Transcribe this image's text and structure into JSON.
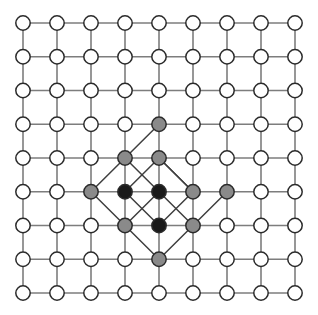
{
  "figure": {
    "type": "node-link-diagram",
    "canvas": {
      "width": 318,
      "height": 315,
      "background": "#ffffff"
    },
    "grid": {
      "columns": 9,
      "rows": 9,
      "origin_x": 23,
      "origin_y": 23,
      "spacing_x": 34,
      "spacing_y": 33.75,
      "node_radius": 7.2,
      "edge_color": "#7d7d7d",
      "edge_width": 1.6
    },
    "palette": {
      "white": "#ffffff",
      "gray": "#8a8a8a",
      "black": "#1a1a1a",
      "node_outline": "#2b2b2b",
      "grid_edge": "#7d7d7d",
      "diagonal_edge": "#3f3f3f"
    },
    "legend": {
      "white_label": "unoccupied site",
      "gray_label": "boundary site",
      "black_label": "core site"
    },
    "counts": {
      "total_nodes": 81,
      "white_nodes": 69,
      "gray_nodes": 9,
      "black_nodes": 3,
      "grid_edges": 144,
      "diagonal_edges": 14
    },
    "black_nodes": [
      {
        "col": 3,
        "row": 5
      },
      {
        "col": 4,
        "row": 5
      },
      {
        "col": 4,
        "row": 6
      }
    ],
    "gray_nodes": [
      {
        "col": 4,
        "row": 3
      },
      {
        "col": 3,
        "row": 4
      },
      {
        "col": 4,
        "row": 4
      },
      {
        "col": 2,
        "row": 5
      },
      {
        "col": 5,
        "row": 5
      },
      {
        "col": 6,
        "row": 5
      },
      {
        "col": 3,
        "row": 6
      },
      {
        "col": 5,
        "row": 6
      },
      {
        "col": 4,
        "row": 7
      }
    ],
    "diagonal_edges": [
      {
        "from": {
          "col": 3,
          "row": 4
        },
        "to": {
          "col": 4,
          "row": 3
        }
      },
      {
        "from": {
          "col": 2,
          "row": 5
        },
        "to": {
          "col": 3,
          "row": 4
        }
      },
      {
        "from": {
          "col": 3,
          "row": 4
        },
        "to": {
          "col": 4,
          "row": 5
        }
      },
      {
        "from": {
          "col": 4,
          "row": 4
        },
        "to": {
          "col": 3,
          "row": 5
        }
      },
      {
        "from": {
          "col": 4,
          "row": 4
        },
        "to": {
          "col": 5,
          "row": 5
        }
      },
      {
        "from": {
          "col": 5,
          "row": 5
        },
        "to": {
          "col": 4,
          "row": 4
        }
      },
      {
        "from": {
          "col": 2,
          "row": 5
        },
        "to": {
          "col": 3,
          "row": 6
        }
      },
      {
        "from": {
          "col": 3,
          "row": 5
        },
        "to": {
          "col": 4,
          "row": 6
        }
      },
      {
        "from": {
          "col": 4,
          "row": 5
        },
        "to": {
          "col": 3,
          "row": 6
        }
      },
      {
        "from": {
          "col": 4,
          "row": 5
        },
        "to": {
          "col": 5,
          "row": 6
        }
      },
      {
        "from": {
          "col": 5,
          "row": 5
        },
        "to": {
          "col": 4,
          "row": 6
        }
      },
      {
        "from": {
          "col": 3,
          "row": 6
        },
        "to": {
          "col": 4,
          "row": 7
        }
      },
      {
        "from": {
          "col": 4,
          "row": 7
        },
        "to": {
          "col": 5,
          "row": 6
        }
      },
      {
        "from": {
          "col": 5,
          "row": 6
        },
        "to": {
          "col": 6,
          "row": 5
        }
      }
    ]
  }
}
